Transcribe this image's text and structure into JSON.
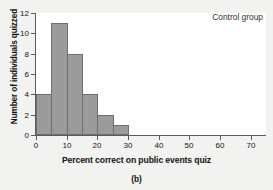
{
  "chart_data": {
    "type": "bar",
    "title": "",
    "subtitle": "",
    "annotation": "Control group",
    "caption": "(b)",
    "xlabel": "Percent correct on public events quiz",
    "ylabel": "Number of individuals quizzed",
    "xlim": [
      0,
      75
    ],
    "ylim": [
      0,
      12
    ],
    "grid": false,
    "legend": null,
    "bin_width": 5,
    "bar_color": "#9b9b9b",
    "bar_edge_color": "#6e6e6e",
    "axis_color": "#5b5b5b",
    "plot_background": "#ffffff",
    "page_background": "#f2f2f0",
    "xticks": [
      0,
      10,
      20,
      30,
      40,
      50,
      60,
      70
    ],
    "xtick_labels": [
      "0",
      "10",
      "20",
      "30",
      "40",
      "50",
      "60",
      "70"
    ],
    "yticks": [
      0,
      2,
      4,
      6,
      8,
      10,
      12
    ],
    "ytick_labels": [
      "0",
      "2",
      "4",
      "6",
      "8",
      "10",
      "12"
    ],
    "categories": [
      "0-5",
      "5-10",
      "10-15",
      "15-20",
      "20-25",
      "25-30"
    ],
    "bin_starts": [
      0,
      5,
      10,
      15,
      20,
      25
    ],
    "bin_ends": [
      5,
      10,
      15,
      20,
      25,
      30
    ],
    "values": [
      4,
      11,
      8,
      4,
      2,
      1
    ]
  }
}
